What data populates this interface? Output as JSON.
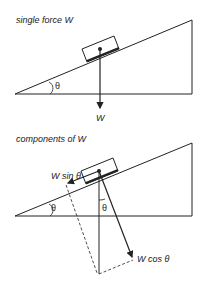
{
  "top": {
    "title": "single force W",
    "theta": "θ",
    "force": "W"
  },
  "bottom": {
    "title": "components of W",
    "theta_left": "θ",
    "theta_mid": "θ",
    "w_sin": "W sin θ",
    "w_cos": "W cos θ"
  }
}
